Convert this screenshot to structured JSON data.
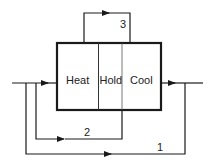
{
  "diagram": {
    "sections": [
      {
        "label": "Heat"
      },
      {
        "label": "Hold"
      },
      {
        "label": "Cool"
      }
    ],
    "loops": [
      {
        "label": "1"
      },
      {
        "label": "2"
      },
      {
        "label": "3"
      }
    ],
    "colors": {
      "line": "#1a1a1a"
    }
  }
}
